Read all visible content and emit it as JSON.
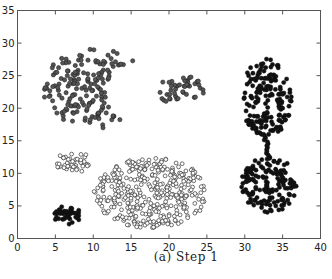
{
  "caption": "(a)  Step 1",
  "colors": {
    "axis": "#555555",
    "gray_fill": "#555555",
    "gray_stroke": "#222222",
    "hollow_fill": "#ffffff",
    "hollow_stroke": "#333333",
    "black_fill": "#111111"
  },
  "chart_data": {
    "type": "scatter",
    "title": "",
    "caption": "(a) Step 1",
    "xlabel": "",
    "ylabel": "",
    "xlim": [
      0,
      40
    ],
    "ylim": [
      0,
      35
    ],
    "xticks": [
      0,
      5,
      10,
      15,
      20,
      25,
      30,
      35,
      40
    ],
    "yticks": [
      0,
      5,
      10,
      15,
      20,
      25,
      30,
      35
    ],
    "grid": false,
    "legend": null,
    "series": [
      {
        "name": "cluster-crescent",
        "marker": "circle-filled-gray",
        "count": 170,
        "x_range": [
          3.5,
          17.5
        ],
        "y_range": [
          16.5,
          29.2
        ],
        "center": [
          10,
          23
        ],
        "shape": "crescent opening right"
      },
      {
        "name": "cluster-small-right-top",
        "marker": "circle-filled-gray",
        "count": 45,
        "x_range": [
          18.5,
          25
        ],
        "y_range": [
          20,
          25.5
        ],
        "center": [
          21.5,
          22.8
        ]
      },
      {
        "name": "cluster-upper-right-blob",
        "marker": "circle-filled-black",
        "count": 170,
        "x_range": [
          29.5,
          36.5
        ],
        "y_range": [
          15,
          28
        ],
        "center": [
          32.8,
          21.5
        ],
        "note": "connected by thin bridge to lower-right blob around x=33, y=12-15"
      },
      {
        "name": "cluster-lower-right-blob",
        "marker": "circle-filled-black",
        "count": 150,
        "x_range": [
          29.5,
          37
        ],
        "y_range": [
          3.5,
          12.5
        ],
        "center": [
          33.2,
          8.5
        ]
      },
      {
        "name": "cluster-upper-left-hollow",
        "marker": "circle-hollow",
        "count": 45,
        "x_range": [
          5,
          10
        ],
        "y_range": [
          10,
          13.5
        ],
        "center": [
          7.3,
          11.6
        ]
      },
      {
        "name": "cluster-large-hollow",
        "marker": "circle-hollow",
        "count": 380,
        "x_range": [
          10,
          25
        ],
        "y_range": [
          1.5,
          12.5
        ],
        "center": [
          17.5,
          7
        ],
        "shape": "ellipse"
      },
      {
        "name": "cluster-small-black",
        "marker": "circle-filled-black",
        "count": 40,
        "x_range": [
          4.8,
          8.5
        ],
        "y_range": [
          2,
          5
        ],
        "center": [
          6.6,
          3.5
        ]
      }
    ],
    "generator": [
      {
        "type": "crescent",
        "cx": 10.3,
        "cy": 23.0,
        "rx": 6.9,
        "ry": 6.2,
        "cutx": 17.5,
        "cuty": 22.3,
        "cutr": 5.8,
        "n": 175,
        "style": "gray",
        "seed": 11
      },
      {
        "type": "ellipse",
        "cx": 21.6,
        "cy": 22.7,
        "rx": 3.0,
        "ry": 2.3,
        "n": 45,
        "style": "gray",
        "seed": 23
      },
      {
        "type": "ellipse",
        "cx": 32.8,
        "cy": 21.5,
        "rx": 3.4,
        "ry": 6.3,
        "n": 175,
        "style": "black",
        "seed": 37
      },
      {
        "type": "line",
        "x1": 33.1,
        "y1": 12.2,
        "x2": 32.7,
        "y2": 16.0,
        "n": 14,
        "style": "black",
        "seed": 41
      },
      {
        "type": "ellipse",
        "cx": 33.2,
        "cy": 8.3,
        "rx": 3.7,
        "ry": 4.4,
        "n": 150,
        "style": "black",
        "seed": 53
      },
      {
        "type": "ellipse",
        "cx": 7.4,
        "cy": 11.7,
        "rx": 2.4,
        "ry": 1.6,
        "n": 45,
        "style": "hollow",
        "seed": 67
      },
      {
        "type": "ellipse",
        "cx": 17.6,
        "cy": 7.0,
        "rx": 7.5,
        "ry": 5.4,
        "n": 380,
        "style": "hollow",
        "seed": 71
      },
      {
        "type": "ellipse",
        "cx": 6.6,
        "cy": 3.5,
        "rx": 1.9,
        "ry": 1.5,
        "n": 42,
        "style": "black",
        "seed": 83
      }
    ]
  }
}
